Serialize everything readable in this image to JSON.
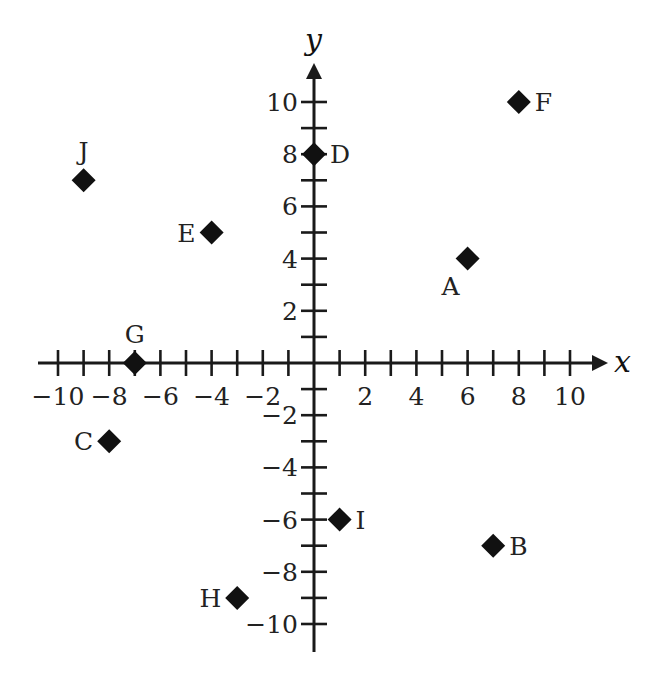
{
  "chart_data": {
    "type": "scatter",
    "title": "",
    "xlabel": "x",
    "ylabel": "y",
    "xlim": [
      -10,
      10
    ],
    "ylim": [
      -10,
      10
    ],
    "grid": false,
    "marker": "diamond",
    "x_tick_labels": [
      "-10",
      "-8",
      "-6",
      "-4",
      "-2",
      "2",
      "4",
      "6",
      "8",
      "10"
    ],
    "y_tick_labels": [
      "10",
      "8",
      "6",
      "4",
      "2",
      "-2",
      "-4",
      "-6",
      "-8",
      "-10"
    ],
    "points": [
      {
        "label": "A",
        "x": 6,
        "y": 4,
        "label_pos": "below-left"
      },
      {
        "label": "B",
        "x": 7,
        "y": -7,
        "label_pos": "right"
      },
      {
        "label": "C",
        "x": -8,
        "y": -3,
        "label_pos": "left"
      },
      {
        "label": "D",
        "x": 0,
        "y": 8,
        "label_pos": "right"
      },
      {
        "label": "E",
        "x": -4,
        "y": 5,
        "label_pos": "left"
      },
      {
        "label": "F",
        "x": 8,
        "y": 10,
        "label_pos": "right"
      },
      {
        "label": "G",
        "x": -7,
        "y": 0,
        "label_pos": "above"
      },
      {
        "label": "H",
        "x": -3,
        "y": -9,
        "label_pos": "left"
      },
      {
        "label": "I",
        "x": 1,
        "y": -6,
        "label_pos": "right"
      },
      {
        "label": "J",
        "x": -9,
        "y": 7,
        "label_pos": "above"
      }
    ]
  },
  "colors": {
    "axis": "#1a1a1a",
    "marker": "#111111",
    "text": "#222222",
    "background": "#ffffff"
  }
}
